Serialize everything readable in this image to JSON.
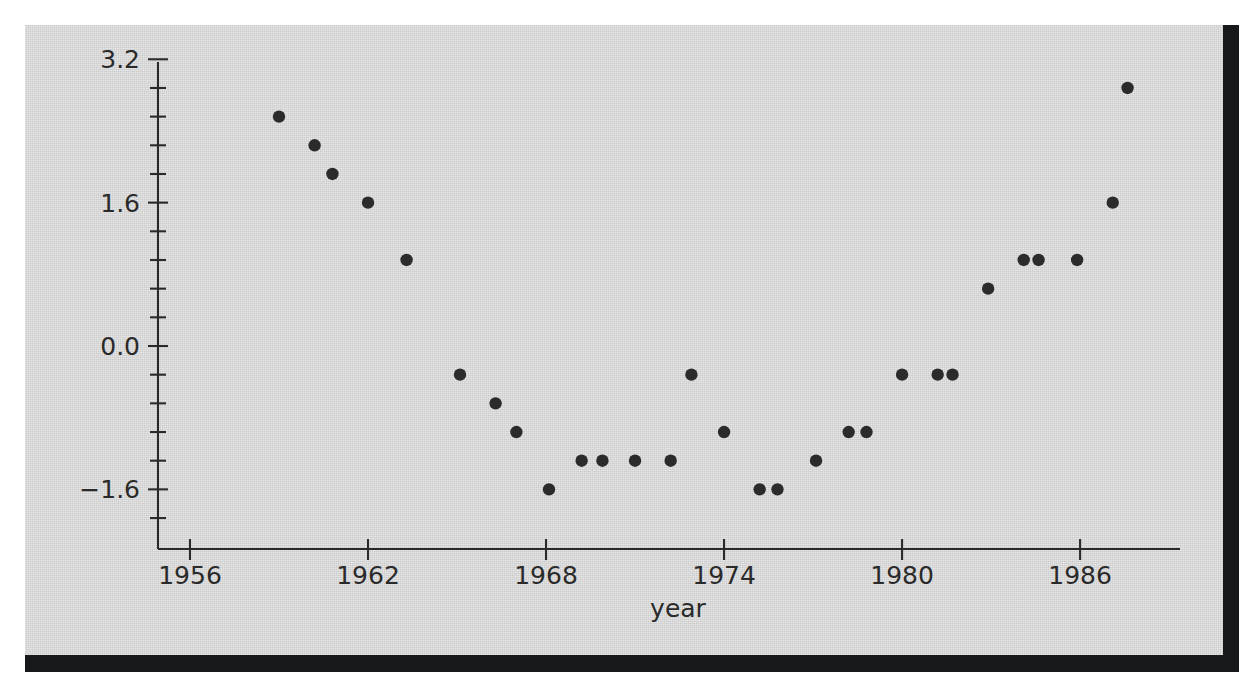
{
  "figure": {
    "background_color": "#d4d4d4",
    "page_color": "#ffffff",
    "edge_shadow_color": "#16181a",
    "ink_color": "#2a2a2a",
    "marker_color": "#2b2b2b"
  },
  "chart_data": {
    "type": "scatter",
    "title": "",
    "subtitle": "",
    "xlabel": "year",
    "ylabel": "",
    "xlim": [
      1954.8,
      1989.0
    ],
    "ylim": [
      -2.24,
      3.2
    ],
    "grid": false,
    "legend": null,
    "xticks": [
      1956,
      1962,
      1968,
      1974,
      1980,
      1986
    ],
    "xtick_labels": [
      "1956",
      "1962",
      "1968",
      "1974",
      "1980",
      "1986"
    ],
    "x_minor_ticks": [],
    "yticks": [
      -1.6,
      0.0,
      1.6,
      3.2
    ],
    "ytick_labels": [
      "−1.6",
      "0.0",
      "1.6",
      "3.2"
    ],
    "y_minor_ticks": [
      -1.92,
      -1.28,
      -0.96,
      -0.64,
      -0.32,
      0.32,
      0.64,
      0.96,
      1.28,
      1.92,
      2.24,
      2.56,
      2.88
    ],
    "x": [
      1959.0,
      1960.2,
      1960.8,
      1962.0,
      1963.3,
      1965.1,
      1966.3,
      1967.0,
      1968.1,
      1969.2,
      1969.9,
      1971.0,
      1972.2,
      1972.9,
      1974.0,
      1975.2,
      1975.8,
      1977.1,
      1978.2,
      1978.8,
      1980.0,
      1981.2,
      1981.7,
      1982.9,
      1984.1,
      1984.6,
      1985.9,
      1987.1,
      1987.6
    ],
    "y": [
      2.56,
      2.24,
      1.92,
      1.6,
      0.96,
      -0.32,
      -0.64,
      -0.96,
      -1.6,
      -1.28,
      -1.28,
      -1.28,
      -1.28,
      -0.32,
      -0.96,
      -1.6,
      -1.6,
      -1.28,
      -0.96,
      -0.96,
      -0.32,
      -0.32,
      -0.32,
      0.64,
      0.96,
      0.96,
      0.96,
      1.6,
      2.88
    ],
    "points": [
      {
        "x": 1959.0,
        "y": 2.56
      },
      {
        "x": 1960.2,
        "y": 2.24
      },
      {
        "x": 1960.8,
        "y": 1.92
      },
      {
        "x": 1962.0,
        "y": 1.6
      },
      {
        "x": 1963.3,
        "y": 0.96
      },
      {
        "x": 1965.1,
        "y": -0.32
      },
      {
        "x": 1966.3,
        "y": -0.64
      },
      {
        "x": 1967.0,
        "y": -0.96
      },
      {
        "x": 1968.1,
        "y": -1.6
      },
      {
        "x": 1969.2,
        "y": -1.28
      },
      {
        "x": 1969.9,
        "y": -1.28
      },
      {
        "x": 1971.0,
        "y": -1.28
      },
      {
        "x": 1972.2,
        "y": -1.28
      },
      {
        "x": 1972.9,
        "y": -0.32
      },
      {
        "x": 1974.0,
        "y": -0.96
      },
      {
        "x": 1975.2,
        "y": -1.6
      },
      {
        "x": 1975.8,
        "y": -1.6
      },
      {
        "x": 1977.1,
        "y": -1.28
      },
      {
        "x": 1978.2,
        "y": -0.96
      },
      {
        "x": 1978.8,
        "y": -0.96
      },
      {
        "x": 1980.0,
        "y": -0.32
      },
      {
        "x": 1981.2,
        "y": -0.32
      },
      {
        "x": 1981.7,
        "y": -0.32
      },
      {
        "x": 1982.9,
        "y": 0.64
      },
      {
        "x": 1984.1,
        "y": 0.96
      },
      {
        "x": 1984.6,
        "y": 0.96
      },
      {
        "x": 1985.9,
        "y": 0.96
      },
      {
        "x": 1987.1,
        "y": 1.6
      },
      {
        "x": 1987.6,
        "y": 2.88
      }
    ],
    "marker": {
      "shape": "circle",
      "radius_px": 6.2
    }
  }
}
